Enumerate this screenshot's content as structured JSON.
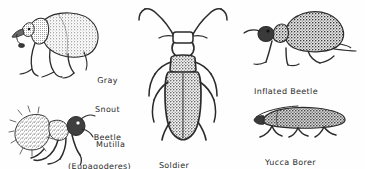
{
  "plate": {
    "kind": "insect-illustration-plate",
    "background_color": "#fefefe",
    "ink_color": "#2b2b2b",
    "width": 365,
    "height": 169
  },
  "figures": [
    {
      "id": "gray-snout-beetle",
      "common_name": "Gray Snout Beetle",
      "genus": "Eupagoderes",
      "label_lines": [
        "Gray",
        "Snout",
        "Beetle",
        "(Eupagoderes)"
      ],
      "view": "lateral",
      "position": "top-left"
    },
    {
      "id": "mutilla",
      "common_name": "Mutilla",
      "genus": "Mutilla",
      "label_lines": [
        "Mutilla"
      ],
      "view": "lateral",
      "position": "bottom-left"
    },
    {
      "id": "soldier-beetle",
      "common_name": "Soldier Beetle",
      "genus": "Lytta",
      "label_lines": [
        "Soldier",
        "Beetle(Lytta)"
      ],
      "view": "dorsal",
      "position": "center"
    },
    {
      "id": "inflated-beetle",
      "common_name": "Inflated Beetle",
      "genus": "",
      "label_lines": [
        "Inflated Beetle"
      ],
      "view": "lateral",
      "position": "top-right"
    },
    {
      "id": "yucca-borer",
      "common_name": "Yucca Borer",
      "genus": "",
      "label_lines": [
        "Yucca Borer"
      ],
      "view": "lateral",
      "position": "bottom-right"
    }
  ],
  "labels": {
    "gray_snout_l1": "Gray",
    "gray_snout_l2": "Snout",
    "gray_snout_l3": "Beetle",
    "gray_snout_l4": "(Eupagoderes)",
    "mutilla": "Mutilla",
    "soldier_l1": "Soldier",
    "soldier_l2": "Beetle(Lytta)",
    "inflated": "Inflated Beetle",
    "yucca": "Yucca Borer"
  }
}
